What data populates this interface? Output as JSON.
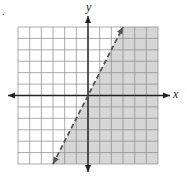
{
  "chart_data": {
    "type": "line",
    "title": "",
    "xlabel": "x",
    "ylabel": "y",
    "xlim": [
      -6,
      6
    ],
    "ylim": [
      -6,
      6
    ],
    "grid": true,
    "grid_step": 1,
    "boundary": {
      "equation": "y = 2x",
      "style": "dashed",
      "points": [
        [
          -3,
          -6
        ],
        [
          3,
          6
        ]
      ]
    },
    "shaded_region": "right/below the line (y < 2x)",
    "inequality": "y < 2x",
    "colors": {
      "shade": "#d6d6d6",
      "grid": "#888888",
      "axis": "#222222",
      "boundary": "#555555"
    }
  },
  "labels": {
    "marker": ".",
    "x_axis": "x",
    "y_axis": "y"
  }
}
